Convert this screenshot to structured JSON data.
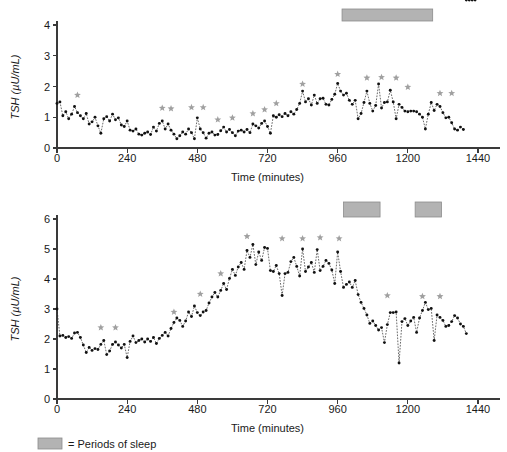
{
  "figure": {
    "legend_label": "= Periods of sleep",
    "sleep_color": "#b3b3b3",
    "star_color": "#a0a0a0",
    "series_color": "#111111"
  },
  "chart_data": [
    {
      "id": "panel-top",
      "type": "line",
      "title": "",
      "xlabel": "Time (minutes)",
      "ylabel": "TSH (µU/mL)",
      "xlim": [
        0,
        1440
      ],
      "ylim": [
        0,
        4
      ],
      "xticks": [
        0,
        240,
        480,
        720,
        960,
        1200,
        1440
      ],
      "yticks": [
        0,
        1,
        2,
        3,
        4
      ],
      "grid": false,
      "legend_position": "below-figure",
      "marker": "filled-circle",
      "linestyle": "dashed",
      "sample_interval_minutes": 10,
      "x": [
        0,
        10,
        20,
        30,
        40,
        50,
        60,
        70,
        80,
        90,
        100,
        110,
        120,
        130,
        140,
        150,
        160,
        170,
        180,
        190,
        200,
        210,
        220,
        230,
        240,
        250,
        260,
        270,
        280,
        290,
        300,
        310,
        320,
        330,
        340,
        350,
        360,
        370,
        380,
        390,
        400,
        410,
        420,
        430,
        440,
        450,
        460,
        470,
        480,
        490,
        500,
        510,
        520,
        530,
        540,
        550,
        560,
        570,
        580,
        590,
        600,
        610,
        620,
        630,
        640,
        650,
        660,
        670,
        680,
        690,
        700,
        710,
        720,
        730,
        740,
        750,
        760,
        770,
        780,
        790,
        800,
        810,
        820,
        830,
        840,
        850,
        860,
        870,
        880,
        890,
        900,
        910,
        920,
        930,
        940,
        950,
        960,
        970,
        980,
        990,
        1000,
        1010,
        1020,
        1030,
        1040,
        1050,
        1060,
        1070,
        1080,
        1090,
        1100,
        1110,
        1120,
        1130,
        1140,
        1150,
        1160,
        1170,
        1180,
        1190,
        1200,
        1210,
        1220,
        1230,
        1240,
        1250,
        1260,
        1270,
        1280,
        1290,
        1300,
        1310,
        1320,
        1330,
        1340,
        1350,
        1360,
        1370,
        1380,
        1390,
        1400,
        1410,
        1420,
        1430
      ],
      "values": [
        1.45,
        1.5,
        1.05,
        1.18,
        0.95,
        1.1,
        1.35,
        1.15,
        1.05,
        0.95,
        1.12,
        0.78,
        0.85,
        1.0,
        0.72,
        0.48,
        0.95,
        1.02,
        0.88,
        1.1,
        0.92,
        0.98,
        0.75,
        0.7,
        0.88,
        0.58,
        0.55,
        0.62,
        0.45,
        0.42,
        0.48,
        0.52,
        0.44,
        0.68,
        0.55,
        0.8,
        0.88,
        0.62,
        0.78,
        0.58,
        0.45,
        0.3,
        0.4,
        0.52,
        0.45,
        0.62,
        0.5,
        0.3,
        0.98,
        0.62,
        0.5,
        0.32,
        0.48,
        0.52,
        0.42,
        0.44,
        0.56,
        0.68,
        0.52,
        0.6,
        0.5,
        0.4,
        0.55,
        0.58,
        0.52,
        0.6,
        0.5,
        0.78,
        0.72,
        0.65,
        0.8,
        0.88,
        0.7,
        0.48,
        1.05,
        1.0,
        1.08,
        1.02,
        1.12,
        1.05,
        1.18,
        1.1,
        1.25,
        1.45,
        1.85,
        1.5,
        1.6,
        1.4,
        1.72,
        1.45,
        1.6,
        1.62,
        1.42,
        1.4,
        1.58,
        1.75,
        2.1,
        1.85,
        1.72,
        1.78,
        1.55,
        1.42,
        1.55,
        0.95,
        1.12,
        1.48,
        1.85,
        1.45,
        1.2,
        1.38,
        2.08,
        1.3,
        1.48,
        1.5,
        1.88,
        1.5,
        0.95,
        1.42,
        1.32,
        1.2,
        1.18,
        1.2,
        1.2,
        1.18,
        1.1,
        1.0,
        0.62,
        1.1,
        1.48,
        1.22,
        1.42,
        1.35,
        1.15,
        0.98,
        1.0,
        0.82,
        0.62,
        0.58,
        0.68,
        0.6
      ],
      "markers_asterisk": [
        {
          "x": 70,
          "y": 1.72
        },
        {
          "x": 360,
          "y": 1.3
        },
        {
          "x": 390,
          "y": 1.28
        },
        {
          "x": 460,
          "y": 1.32
        },
        {
          "x": 500,
          "y": 1.32
        },
        {
          "x": 550,
          "y": 0.92
        },
        {
          "x": 600,
          "y": 0.98
        },
        {
          "x": 670,
          "y": 1.12
        },
        {
          "x": 710,
          "y": 1.25
        },
        {
          "x": 750,
          "y": 1.45
        },
        {
          "x": 840,
          "y": 2.08
        },
        {
          "x": 960,
          "y": 2.4
        },
        {
          "x": 1060,
          "y": 2.28
        },
        {
          "x": 1110,
          "y": 2.3
        },
        {
          "x": 1160,
          "y": 2.28
        },
        {
          "x": 1200,
          "y": 1.98
        },
        {
          "x": 1310,
          "y": 1.78
        },
        {
          "x": 1350,
          "y": 1.78
        }
      ],
      "sleep_periods": [
        {
          "start": 975,
          "end": 1285
        }
      ]
    },
    {
      "id": "panel-bottom",
      "type": "line",
      "title": "",
      "xlabel": "Time (minutes)",
      "ylabel": "TSH (µU/mL)",
      "xlim": [
        0,
        1440
      ],
      "ylim": [
        0,
        6
      ],
      "xticks": [
        0,
        240,
        480,
        720,
        960,
        1200,
        1440
      ],
      "yticks": [
        0,
        1,
        2,
        3,
        4,
        5,
        6
      ],
      "grid": false,
      "legend_position": "below-figure",
      "marker": "filled-circle",
      "linestyle": "dashed",
      "sample_interval_minutes": 10,
      "x": [
        0,
        10,
        20,
        30,
        40,
        50,
        60,
        70,
        80,
        90,
        100,
        110,
        120,
        130,
        140,
        150,
        160,
        170,
        180,
        190,
        200,
        210,
        220,
        230,
        240,
        250,
        260,
        270,
        280,
        290,
        300,
        310,
        320,
        330,
        340,
        350,
        360,
        370,
        380,
        390,
        400,
        410,
        420,
        430,
        440,
        450,
        460,
        470,
        480,
        490,
        500,
        510,
        520,
        530,
        540,
        550,
        560,
        570,
        580,
        590,
        600,
        610,
        620,
        630,
        640,
        650,
        660,
        670,
        680,
        690,
        700,
        710,
        720,
        730,
        740,
        750,
        760,
        770,
        780,
        790,
        800,
        810,
        820,
        830,
        840,
        850,
        860,
        870,
        880,
        890,
        900,
        910,
        920,
        930,
        940,
        950,
        960,
        970,
        980,
        990,
        1000,
        1010,
        1020,
        1030,
        1040,
        1050,
        1060,
        1070,
        1080,
        1090,
        1100,
        1110,
        1120,
        1130,
        1140,
        1150,
        1160,
        1170,
        1180,
        1190,
        1200,
        1210,
        1220,
        1230,
        1240,
        1250,
        1260,
        1270,
        1280,
        1290,
        1300,
        1310,
        1320,
        1330,
        1340,
        1350,
        1360,
        1370,
        1380,
        1390,
        1400
      ],
      "values": [
        3.0,
        2.1,
        2.12,
        2.05,
        2.08,
        2.02,
        2.2,
        2.22,
        2.05,
        1.8,
        1.55,
        1.72,
        1.62,
        1.68,
        1.65,
        1.82,
        1.95,
        1.48,
        1.6,
        1.82,
        1.9,
        1.8,
        1.7,
        1.82,
        1.38,
        1.92,
        2.1,
        1.88,
        1.95,
        2.0,
        1.9,
        2.0,
        1.92,
        2.05,
        1.85,
        2.02,
        2.12,
        2.22,
        2.1,
        2.35,
        2.55,
        2.7,
        2.62,
        2.42,
        2.6,
        2.9,
        2.75,
        3.1,
        2.88,
        2.78,
        2.9,
        2.95,
        3.2,
        3.4,
        3.55,
        3.4,
        3.62,
        3.85,
        3.65,
        4.02,
        4.32,
        4.12,
        4.4,
        4.55,
        4.32,
        4.95,
        4.72,
        5.15,
        4.48,
        4.9,
        4.62,
        5.05,
        5.02,
        4.28,
        4.25,
        4.45,
        4.18,
        3.45,
        4.18,
        4.22,
        4.58,
        4.72,
        4.42,
        4.1,
        5.0,
        4.25,
        4.4,
        4.55,
        4.22,
        4.98,
        4.28,
        4.42,
        4.62,
        4.52,
        4.3,
        3.85,
        4.9,
        4.25,
        3.72,
        3.82,
        3.9,
        3.72,
        3.95,
        3.48,
        3.22,
        3.02,
        2.8,
        2.52,
        2.6,
        2.45,
        2.3,
        2.38,
        1.88,
        2.48,
        2.88,
        2.88,
        2.9,
        1.2,
        2.58,
        2.68,
        2.45,
        2.6,
        2.72,
        2.22,
        2.7,
        2.95,
        3.22,
        2.98,
        3.02,
        1.95,
        2.8,
        2.72,
        2.62,
        2.42,
        2.45,
        2.58,
        2.78,
        2.7,
        2.5,
        2.42,
        2.18
      ],
      "markers_asterisk": [
        {
          "x": 150,
          "y": 2.38
        },
        {
          "x": 200,
          "y": 2.38
        },
        {
          "x": 400,
          "y": 2.9
        },
        {
          "x": 490,
          "y": 3.5
        },
        {
          "x": 560,
          "y": 4.18
        },
        {
          "x": 650,
          "y": 5.42
        },
        {
          "x": 770,
          "y": 5.35
        },
        {
          "x": 840,
          "y": 5.35
        },
        {
          "x": 900,
          "y": 5.38
        },
        {
          "x": 965,
          "y": 5.35
        },
        {
          "x": 1130,
          "y": 3.45
        },
        {
          "x": 1250,
          "y": 3.42
        },
        {
          "x": 1310,
          "y": 3.42
        }
      ],
      "sleep_periods": [
        {
          "start": 980,
          "end": 1105
        },
        {
          "start": 1225,
          "end": 1315
        }
      ]
    }
  ]
}
